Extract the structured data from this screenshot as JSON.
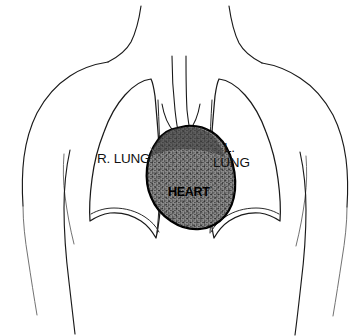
{
  "figure": {
    "background_color": "#ffffff",
    "ink_color": "#1a1a1a"
  },
  "labels": {
    "right_lung": "R. LUNG",
    "left_lung_line1": "L.",
    "left_lung_line2": "LUNG",
    "heart": "HEART"
  },
  "structures": {
    "right_lung": {
      "name": "right-lung",
      "fill": "#ffffff",
      "stroke": "#1a1a1a"
    },
    "left_lung": {
      "name": "left-lung",
      "fill": "#ffffff",
      "stroke": "#1a1a1a"
    },
    "heart": {
      "name": "heart",
      "fill": "#808080",
      "stroke": "#000000",
      "texture": "stipple"
    },
    "trachea": {
      "name": "trachea",
      "stroke": "#1a1a1a"
    },
    "torso": {
      "name": "torso-outline",
      "stroke": "#1a1a1a"
    }
  }
}
